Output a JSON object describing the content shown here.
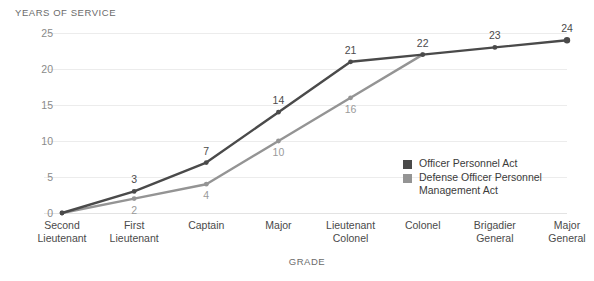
{
  "chart_data": {
    "type": "line",
    "title": "",
    "ylabel": "YEARS OF SERVICE",
    "xlabel": "GRADE",
    "categories": [
      "Second Lieutenant",
      "First Lieutenant",
      "Captain",
      "Major",
      "Lieutenant Colonel",
      "Colonel",
      "Brigadier General",
      "Major General"
    ],
    "category_lines": [
      [
        "Second",
        "Lieutenant"
      ],
      [
        "First",
        "Lieutenant"
      ],
      [
        "Captain"
      ],
      [
        "Major"
      ],
      [
        "Lieutenant",
        "Colonel"
      ],
      [
        "Colonel"
      ],
      [
        "Brigadier",
        "General"
      ],
      [
        "Major",
        "General"
      ]
    ],
    "ylim": [
      0,
      25
    ],
    "yticks": [
      0,
      5,
      10,
      15,
      20,
      25
    ],
    "grid": true,
    "legend_position": "inside-right",
    "series": [
      {
        "name": "Officer Personnel Act",
        "color": "#4a4a4a",
        "label_position": "above",
        "values": [
          0,
          3,
          7,
          14,
          21,
          22,
          23,
          24
        ],
        "labels": [
          "",
          "3",
          "7",
          "14",
          "21",
          "22",
          "23",
          "24"
        ]
      },
      {
        "name": "Defense Officer Personnel Management Act",
        "color": "#949494",
        "label_position": "below",
        "values": [
          0,
          2,
          4,
          10,
          16,
          22,
          null,
          null
        ],
        "labels": [
          "",
          "2",
          "4",
          "10",
          "16",
          "",
          "",
          ""
        ]
      }
    ],
    "legend": [
      {
        "label": "Officer Personnel Act",
        "color": "#4a4a4a"
      },
      {
        "label": "Defense Officer Personnel Management Act",
        "color": "#949494"
      }
    ]
  }
}
